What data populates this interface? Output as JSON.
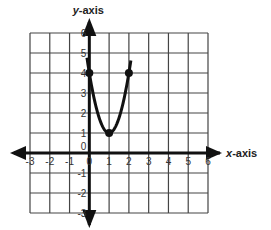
{
  "chart_data": {
    "type": "line",
    "title": "",
    "xlabel": "x-axis",
    "ylabel": "y-axis",
    "xlim": [
      -3,
      6
    ],
    "ylim": [
      -3,
      6
    ],
    "grid": true,
    "x_ticks": [
      "-3",
      "-2",
      "-1",
      "0",
      "1",
      "2",
      "3",
      "4",
      "5",
      "6"
    ],
    "y_ticks": [
      "-3",
      "-2",
      "-1",
      "0",
      "1",
      "2",
      "3",
      "4",
      "5",
      "6"
    ],
    "series": [
      {
        "name": "parabola",
        "equation": "y = 3(x - 1)^2 + 1",
        "x": [
          -0.1,
          0,
          0.5,
          1,
          1.5,
          2,
          2.1
        ],
        "y": [
          4.63,
          4,
          1.75,
          1,
          1.75,
          4,
          4.63
        ]
      }
    ],
    "marked_points": [
      {
        "x": 0,
        "y": 4
      },
      {
        "x": 1,
        "y": 1
      },
      {
        "x": 2,
        "y": 4
      }
    ]
  },
  "labels": {
    "x_axis": "x-axis",
    "y_axis": "y-axis",
    "x_axis_var": "x",
    "y_axis_var": "y"
  }
}
